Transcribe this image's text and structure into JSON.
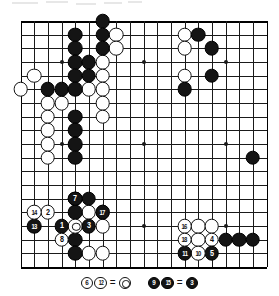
{
  "diagram": {
    "type": "go-board-problem-diagram",
    "board_size": 19,
    "star_points": [
      [
        3,
        3
      ],
      [
        9,
        3
      ],
      [
        15,
        3
      ],
      [
        3,
        9
      ],
      [
        9,
        9
      ],
      [
        15,
        9
      ],
      [
        3,
        15
      ],
      [
        9,
        15
      ],
      [
        15,
        15
      ]
    ],
    "colors": {
      "black": "#141414",
      "white": "#ffffff",
      "line": "#1a1a1a",
      "background": "#ffffff"
    }
  },
  "stones": {
    "black": [
      [
        6,
        0
      ],
      [
        4,
        1
      ],
      [
        6,
        1
      ],
      [
        4,
        2
      ],
      [
        6,
        2
      ],
      [
        4,
        3
      ],
      [
        5,
        3
      ],
      [
        4,
        4
      ],
      [
        5,
        4
      ],
      [
        2,
        5
      ],
      [
        3,
        5
      ],
      [
        4,
        5
      ],
      [
        4,
        7
      ],
      [
        4,
        8
      ],
      [
        4,
        9
      ],
      [
        4,
        10
      ],
      [
        13,
        1
      ],
      [
        14,
        2
      ],
      [
        14,
        4
      ],
      [
        12,
        5
      ],
      [
        17,
        10
      ],
      [
        4,
        13
      ],
      [
        5,
        13
      ],
      [
        4,
        14
      ],
      [
        4,
        16
      ],
      [
        4,
        17
      ],
      [
        15,
        16
      ],
      [
        16,
        16
      ],
      [
        17,
        16
      ]
    ],
    "white": [
      [
        7,
        1
      ],
      [
        7,
        2
      ],
      [
        6,
        3
      ],
      [
        6,
        4
      ],
      [
        1,
        4
      ],
      [
        0,
        5
      ],
      [
        5,
        5
      ],
      [
        6,
        5
      ],
      [
        2,
        6
      ],
      [
        3,
        6
      ],
      [
        6,
        6
      ],
      [
        2,
        7
      ],
      [
        6,
        7
      ],
      [
        2,
        8
      ],
      [
        2,
        9
      ],
      [
        2,
        10
      ],
      [
        12,
        1
      ],
      [
        12,
        2
      ],
      [
        12,
        4
      ],
      [
        20,
        15
      ],
      [
        5,
        14
      ],
      [
        6,
        14
      ],
      [
        6,
        15
      ],
      [
        5,
        17
      ],
      [
        6,
        17
      ],
      [
        13,
        15
      ],
      [
        14,
        15
      ],
      [
        13,
        16
      ]
    ]
  },
  "moves": [
    {
      "n": "1",
      "color": "black",
      "col": 3,
      "row": 15
    },
    {
      "n": "2",
      "color": "white",
      "col": 2,
      "row": 14
    },
    {
      "n": "3",
      "color": "black",
      "col": 5,
      "row": 15
    },
    {
      "n": "4",
      "color": "white",
      "col": 14,
      "row": 16
    },
    {
      "n": "5",
      "color": "black",
      "col": 14,
      "row": 17
    },
    {
      "n": "7",
      "color": "black",
      "col": 4,
      "row": 13
    },
    {
      "n": "8",
      "color": "white",
      "col": 3,
      "row": 16
    },
    {
      "n": "10",
      "color": "white",
      "col": 13,
      "row": 17
    },
    {
      "n": "11",
      "color": "black",
      "col": 12,
      "row": 17
    },
    {
      "n": "13",
      "color": "black",
      "col": 1,
      "row": 15
    },
    {
      "n": "14",
      "color": "white",
      "col": 1,
      "row": 14
    },
    {
      "n": "16",
      "color": "white",
      "col": 12,
      "row": 15
    },
    {
      "n": "17",
      "color": "black",
      "col": 6,
      "row": 14
    },
    {
      "n": "18",
      "color": "white",
      "col": 12,
      "row": 16
    }
  ],
  "marked_white_stone": {
    "col": 4,
    "row": 15
  },
  "caption": {
    "groups": [
      {
        "id": "white-repeat-note",
        "items": [
          {
            "kind": "stone",
            "color": "white",
            "label": "6"
          },
          {
            "kind": "stone",
            "color": "white",
            "label": "12"
          },
          {
            "kind": "equals",
            "label": "="
          },
          {
            "kind": "stone",
            "color": "white",
            "label": "",
            "marked": true
          }
        ]
      },
      {
        "id": "black-repeat-note",
        "items": [
          {
            "kind": "stone",
            "color": "black",
            "label": "9"
          },
          {
            "kind": "stone",
            "color": "black",
            "label": "15"
          },
          {
            "kind": "equals",
            "label": "="
          },
          {
            "kind": "stone",
            "color": "black",
            "label": "3"
          }
        ]
      }
    ]
  }
}
